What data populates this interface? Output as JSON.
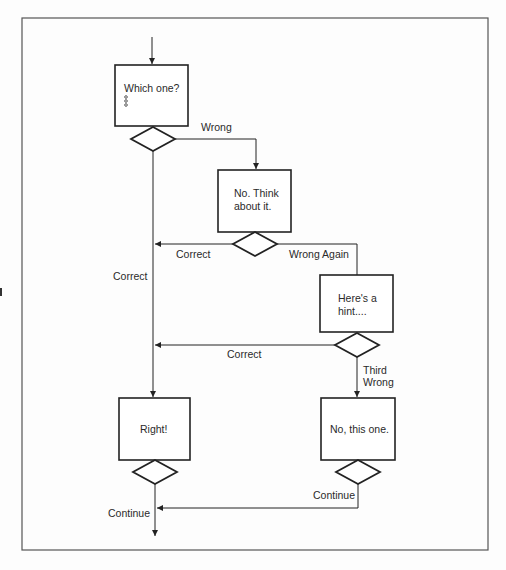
{
  "diagram": {
    "type": "flowchart",
    "nodes": {
      "question": {
        "lines": [
          "Which one?"
        ],
        "options_icon": "three-small-circles"
      },
      "think": {
        "lines": [
          "No. Think",
          "about it."
        ]
      },
      "hint": {
        "lines": [
          "Here's a",
          "hint...."
        ]
      },
      "right": {
        "lines": [
          "Right!"
        ]
      },
      "answer": {
        "lines": [
          "No, this one."
        ]
      }
    },
    "edges": {
      "wrong": "Wrong",
      "correct_1": "Correct",
      "wrong_again": "Wrong Again",
      "correct_main": "Correct",
      "correct_2": "Correct",
      "third_wrong_1": "Third",
      "third_wrong_2": "Wrong",
      "continue_1": "Continue",
      "continue_2": "Continue"
    },
    "colors": {
      "stroke": "#222222",
      "frame": "#555555",
      "background": "#fdfdfd"
    }
  }
}
